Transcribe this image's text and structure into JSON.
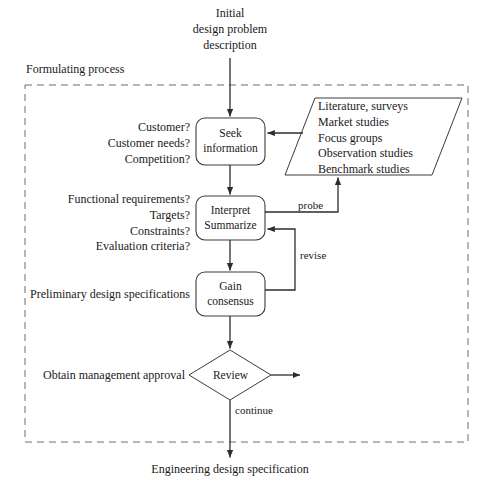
{
  "diagram": {
    "title_top": "Initial\ndesign problem\ndescription",
    "boundary_label": "Formulating process",
    "output_bottom": "Engineering design specification",
    "nodes": {
      "seek": "Seek\ninformation",
      "interpret": "Interpret\nSummarize",
      "consensus": "Gain\nconsensus",
      "review": "Review",
      "sources": "Literature, surveys\nMarket studies\nFocus groups\nObservation studies\nBenchmark studies"
    },
    "annotations": {
      "seek_questions": "Customer?\nCustomer needs?\nCompetition?",
      "interpret_questions": "Functional requirements?\nTargets?\nConstraints?\nEvaluation criteria?",
      "consensus_note": "Preliminary design specifications",
      "review_note": "Obtain management approval"
    },
    "edge_labels": {
      "probe": "probe",
      "revise": "revise",
      "continue": "continue"
    },
    "colors": {
      "stroke": "#3c3c3c",
      "dashed": "#6e6e6e",
      "text": "#1a1a1a",
      "background": "#ffffff"
    }
  }
}
